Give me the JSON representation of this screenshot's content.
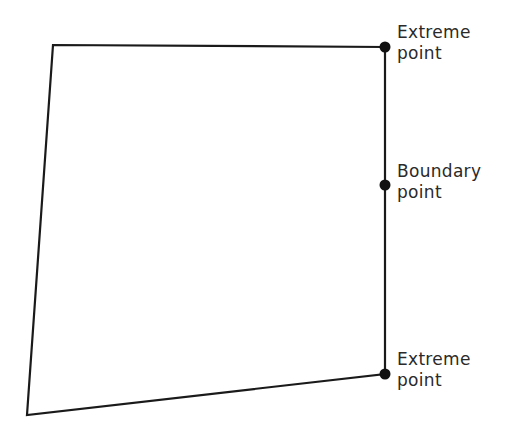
{
  "diagram": {
    "colors": {
      "stroke": "#1a1a1a",
      "point": "#111111",
      "text": "#2a2a2a",
      "background": "#ffffff"
    },
    "polygon": {
      "vertices": [
        {
          "x": 53,
          "y": 45
        },
        {
          "x": 385,
          "y": 47
        },
        {
          "x": 385,
          "y": 374
        },
        {
          "x": 27,
          "y": 415
        }
      ]
    },
    "points": [
      {
        "id": "extreme-top",
        "x": 385,
        "y": 47,
        "label_line1": "Extreme",
        "label_line2": "point",
        "label_top": 22
      },
      {
        "id": "boundary-mid",
        "x": 385,
        "y": 185,
        "label_line1": "Boundary",
        "label_line2": "point",
        "label_top": 161
      },
      {
        "id": "extreme-bottom",
        "x": 385,
        "y": 374,
        "label_line1": "Extreme",
        "label_line2": "point",
        "label_top": 349
      }
    ]
  }
}
